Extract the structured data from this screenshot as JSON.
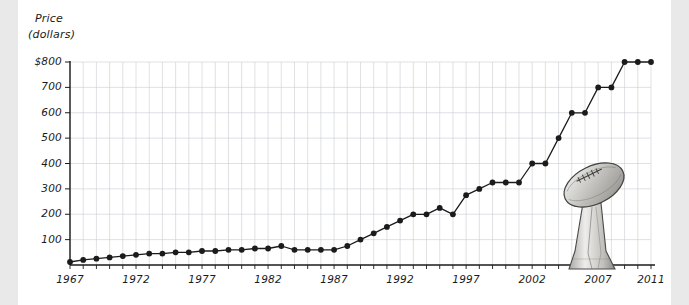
{
  "figure": {
    "background": "#ffffff",
    "page_margin_color": "#e9e9e9",
    "ink_color": "#1b1b1b",
    "grid_color": "#c9ccd4"
  },
  "illustration": {
    "name": "lombardi-trophy",
    "description": "hand-drawn grayscale Vince Lombardi Trophy: a football tilted on a tapered pedestal base"
  },
  "chart_data": {
    "type": "line",
    "title": "",
    "xlabel": "",
    "ylabel": "Price (dollars)",
    "ylabel_line1": "Price",
    "ylabel_line2": "(dollars)",
    "ylim": [
      0,
      800
    ],
    "xlim": [
      1967,
      2011
    ],
    "grid": true,
    "legend": "none",
    "ytick_labels": [
      "$800",
      "700",
      "600",
      "500",
      "400",
      "300",
      "200",
      "100"
    ],
    "ytick_values": [
      800,
      700,
      600,
      500,
      400,
      300,
      200,
      100
    ],
    "xtick_labels": [
      "1967",
      "1972",
      "1977",
      "1982",
      "1987",
      "1992",
      "1997",
      "2002",
      "2007",
      "2011"
    ],
    "xtick_values": [
      1967,
      1972,
      1977,
      1982,
      1987,
      1992,
      1997,
      2002,
      2007,
      2011
    ],
    "x": [
      1967,
      1968,
      1969,
      1970,
      1971,
      1972,
      1973,
      1974,
      1975,
      1976,
      1977,
      1978,
      1979,
      1980,
      1981,
      1982,
      1983,
      1984,
      1985,
      1986,
      1987,
      1988,
      1989,
      1990,
      1991,
      1992,
      1993,
      1994,
      1995,
      1996,
      1997,
      1998,
      1999,
      2000,
      2001,
      2002,
      2003,
      2004,
      2005,
      2006,
      2007,
      2008,
      2009,
      2010,
      2011
    ],
    "values": [
      12,
      20,
      25,
      30,
      35,
      40,
      45,
      45,
      50,
      50,
      55,
      55,
      60,
      60,
      65,
      65,
      75,
      60,
      60,
      60,
      60,
      75,
      100,
      125,
      150,
      175,
      200,
      200,
      225,
      200,
      275,
      300,
      325,
      325,
      325,
      400,
      400,
      500,
      600,
      600,
      700,
      700,
      800,
      800,
      800
    ],
    "series": [
      {
        "name": "Super Bowl ticket price",
        "marker": "circle",
        "color": "#1b1b1b",
        "values": [
          12,
          20,
          25,
          30,
          35,
          40,
          45,
          45,
          50,
          50,
          55,
          55,
          60,
          60,
          65,
          65,
          75,
          60,
          60,
          60,
          60,
          75,
          100,
          125,
          150,
          175,
          200,
          200,
          225,
          200,
          275,
          300,
          325,
          325,
          325,
          400,
          400,
          500,
          600,
          600,
          700,
          700,
          800,
          800,
          800
        ]
      }
    ]
  }
}
